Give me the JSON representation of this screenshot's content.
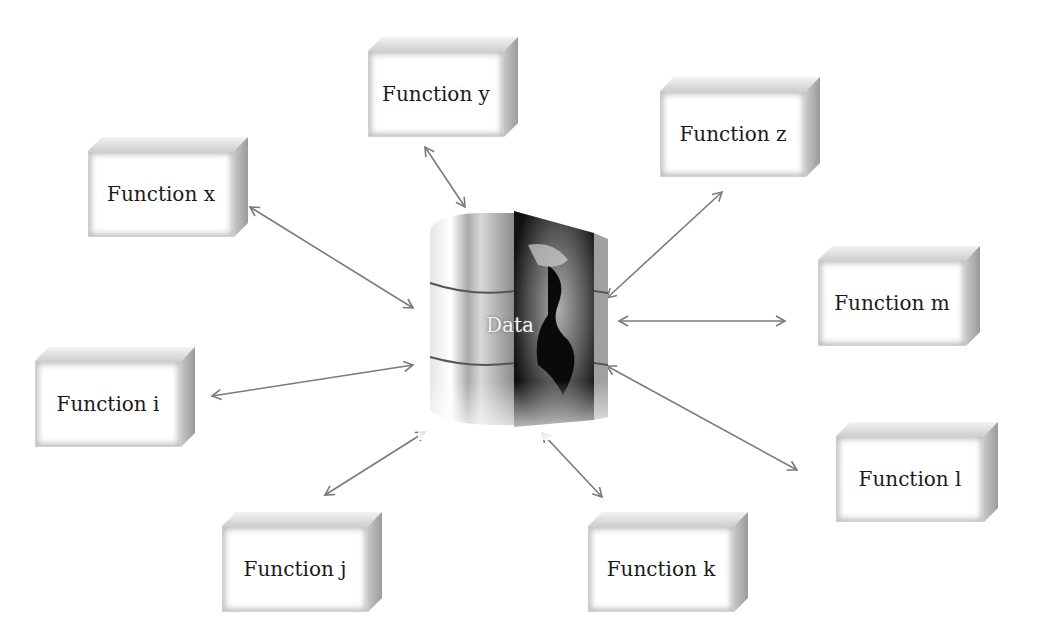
{
  "diagram": {
    "center": {
      "label": "Data",
      "icon": "database-globe-icon"
    },
    "functions": [
      {
        "id": "y",
        "label": "Function y",
        "x": 368,
        "y": 37,
        "w": 150,
        "h": 100
      },
      {
        "id": "z",
        "label": "Function z",
        "x": 660,
        "y": 77,
        "w": 160,
        "h": 100
      },
      {
        "id": "x",
        "label": "Function x",
        "x": 88,
        "y": 137,
        "w": 160,
        "h": 100
      },
      {
        "id": "m",
        "label": "Function m",
        "x": 818,
        "y": 246,
        "w": 162,
        "h": 100
      },
      {
        "id": "i",
        "label": "Function i",
        "x": 35,
        "y": 347,
        "w": 160,
        "h": 100
      },
      {
        "id": "l",
        "label": "Function l",
        "x": 836,
        "y": 422,
        "w": 162,
        "h": 100
      },
      {
        "id": "j",
        "label": "Function j",
        "x": 222,
        "y": 512,
        "w": 160,
        "h": 100
      },
      {
        "id": "k",
        "label": "Function k",
        "x": 588,
        "y": 512,
        "w": 160,
        "h": 100
      }
    ],
    "arrow_color": "#7a7a7a",
    "arrows": [
      {
        "to": "y",
        "x1": 425,
        "y1": 147,
        "x2": 465,
        "y2": 207
      },
      {
        "to": "z",
        "x1": 722,
        "y1": 192,
        "x2": 607,
        "y2": 298
      },
      {
        "to": "x",
        "x1": 250,
        "y1": 207,
        "x2": 413,
        "y2": 308
      },
      {
        "to": "m",
        "x1": 619,
        "y1": 321,
        "x2": 785,
        "y2": 321
      },
      {
        "to": "i",
        "x1": 212,
        "y1": 396,
        "x2": 413,
        "y2": 365
      },
      {
        "to": "l",
        "x1": 607,
        "y1": 366,
        "x2": 797,
        "y2": 470
      },
      {
        "to": "j",
        "x1": 325,
        "y1": 495,
        "x2": 425,
        "y2": 432
      },
      {
        "to": "k",
        "x1": 542,
        "y1": 433,
        "x2": 602,
        "y2": 497
      }
    ]
  }
}
